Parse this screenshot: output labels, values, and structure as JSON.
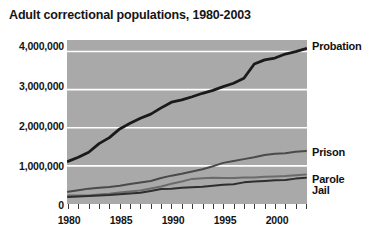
{
  "chart_data": {
    "type": "line",
    "title": "Adult correctional populations, 1980-2003",
    "xlabel": "",
    "ylabel": "",
    "xlim": [
      1980,
      2003
    ],
    "ylim": [
      0,
      4300000
    ],
    "grid": true,
    "legend_position": "right-inline",
    "y_ticks": [
      0,
      1000000,
      2000000,
      3000000,
      4000000
    ],
    "y_tick_labels": [
      "0",
      "1,000,000",
      "2,000,000",
      "3,000,000",
      "4,000,000"
    ],
    "x_ticks": [
      1980,
      1985,
      1990,
      1995,
      2000
    ],
    "x_tick_labels": [
      "1980",
      "1985",
      "1990",
      "1995",
      "2000"
    ],
    "x_minor_ticks": [
      1980,
      1981,
      1982,
      1983,
      1984,
      1985,
      1986,
      1987,
      1988,
      1989,
      1990,
      1991,
      1992,
      1993,
      1994,
      1995,
      1996,
      1997,
      1998,
      1999,
      2000,
      2001,
      2002,
      2003
    ],
    "x": [
      1980,
      1981,
      1982,
      1983,
      1984,
      1985,
      1986,
      1987,
      1988,
      1989,
      1990,
      1991,
      1992,
      1993,
      1994,
      1995,
      1996,
      1997,
      1998,
      1999,
      2000,
      2001,
      2002,
      2003
    ],
    "series": [
      {
        "name": "Probation",
        "color": "#1a1a1a",
        "values": [
          1118097,
          1225934,
          1357264,
          1582947,
          1740948,
          1968712,
          2114621,
          2247158,
          2356483,
          2520479,
          2670234,
          2728472,
          2811611,
          2903061,
          2981022,
          3077861,
          3164996,
          3296513,
          3670441,
          3779922,
          3826209,
          3931731,
          3995165,
          4073987
        ]
      },
      {
        "name": "Prison",
        "color": "#4a4a4a",
        "values": [
          319598,
          360029,
          402914,
          423898,
          448264,
          480568,
          522084,
          560812,
          603732,
          680907,
          743382,
          792535,
          850566,
          909381,
          990147,
          1078542,
          1127528,
          1176564,
          1224469,
          1287172,
          1316333,
          1330007,
          1367547,
          1387269
        ]
      },
      {
        "name": "Parole",
        "color": "#6b6b6b",
        "values": [
          220438,
          225539,
          224604,
          246440,
          266992,
          300203,
          325638,
          355505,
          407977,
          456803,
          531407,
          590442,
          658601,
          676100,
          690371,
          679421,
          679733,
          694787,
          696385,
          714457,
          723898,
          732333,
          750934,
          774588
        ]
      },
      {
        "name": "Jail",
        "color": "#2e2e2e",
        "values": [
          182288,
          195085,
          207853,
          221815,
          233018,
          254986,
          272735,
          294092,
          341893,
          393303,
          403019,
          424129,
          441781,
          455500,
          479800,
          507044,
          518492,
          567079,
          592462,
          605943,
          621149,
          631240,
          665475,
          691301
        ]
      }
    ]
  },
  "axes": {
    "y_label_0": "0",
    "y_label_1": "1,000,000",
    "y_label_2": "2,000,000",
    "y_label_3": "3,000,000",
    "y_label_4": "4,000,000",
    "x_label_0": "1980",
    "x_label_1": "1985",
    "x_label_2": "1990",
    "x_label_3": "1995",
    "x_label_4": "2000"
  },
  "series_labels": {
    "probation": "Probation",
    "prison": "Prison",
    "parole": "Parole",
    "jail": "Jail"
  }
}
